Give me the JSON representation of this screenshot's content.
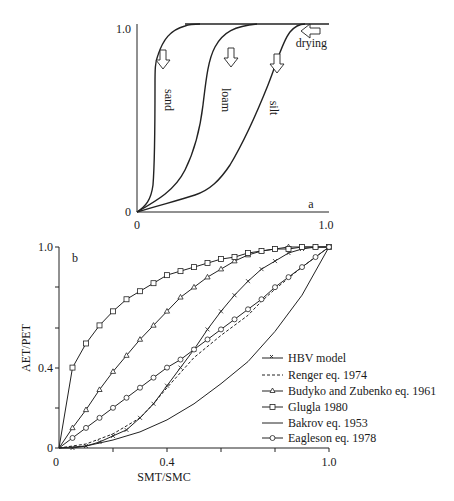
{
  "chart_data": [
    {
      "panel": "a",
      "type": "line",
      "title": "",
      "panel_label": "a",
      "xlabel": "",
      "ylabel": "",
      "xlim": [
        0,
        1.0
      ],
      "ylim": [
        0,
        1.0
      ],
      "x_ticks": [
        "0",
        "1.0"
      ],
      "y_ticks": [
        "0",
        "1.0"
      ],
      "grid": false,
      "annotations": [
        "drying"
      ],
      "series": [
        {
          "name": "sand",
          "x": [
            0,
            0.05,
            0.08,
            0.09,
            0.1,
            0.1,
            0.11,
            0.12,
            0.15,
            0.2,
            0.25,
            0.3,
            1.0
          ],
          "y": [
            0,
            0.05,
            0.15,
            0.4,
            0.6,
            0.8,
            0.9,
            0.93,
            0.97,
            0.99,
            1.0,
            1.0,
            1.0
          ]
        },
        {
          "name": "loam",
          "x": [
            0,
            0.1,
            0.2,
            0.25,
            0.3,
            0.35,
            0.38,
            0.42,
            0.5,
            0.6,
            0.7,
            1.0
          ],
          "y": [
            0,
            0.07,
            0.2,
            0.3,
            0.45,
            0.65,
            0.78,
            0.87,
            0.95,
            0.99,
            1.0,
            1.0
          ]
        },
        {
          "name": "silt",
          "x": [
            0,
            0.15,
            0.3,
            0.4,
            0.5,
            0.6,
            0.7,
            0.8,
            0.85,
            1.0
          ],
          "y": [
            0,
            0.06,
            0.12,
            0.25,
            0.45,
            0.65,
            0.85,
            0.98,
            1.0,
            1.0
          ]
        }
      ]
    },
    {
      "panel": "b",
      "type": "line",
      "title": "",
      "panel_label": "b",
      "xlabel": "SMT/SMC",
      "ylabel": "AET/PET",
      "xlim": [
        0,
        1.0
      ],
      "ylim": [
        0,
        1.0
      ],
      "x_ticks": [
        "0",
        "0.4",
        "1.0"
      ],
      "y_ticks": [
        "0",
        "0.4",
        "1.0"
      ],
      "grid": false,
      "legend_position": "lower right",
      "series": [
        {
          "name": "HBV model",
          "marker": "x",
          "style": "solid",
          "x": [
            0,
            0.05,
            0.1,
            0.15,
            0.2,
            0.25,
            0.3,
            0.35,
            0.4,
            0.45,
            0.5,
            0.55,
            0.6,
            0.65,
            0.7,
            0.75,
            0.8,
            0.85,
            0.9,
            0.95,
            1.0
          ],
          "y": [
            0,
            0.0,
            0.01,
            0.03,
            0.06,
            0.09,
            0.15,
            0.22,
            0.31,
            0.4,
            0.49,
            0.59,
            0.68,
            0.76,
            0.83,
            0.89,
            0.93,
            0.97,
            0.99,
            1.0,
            1.0
          ]
        },
        {
          "name": "Renger eq. 1974",
          "marker": "none",
          "style": "dashed",
          "x": [
            0,
            0.1,
            0.2,
            0.3,
            0.35,
            0.4,
            0.5,
            0.6,
            0.7,
            0.75,
            0.8,
            0.9,
            1.0
          ],
          "y": [
            0,
            0.02,
            0.07,
            0.15,
            0.22,
            0.3,
            0.45,
            0.56,
            0.66,
            0.73,
            0.79,
            0.9,
            1.0
          ]
        },
        {
          "name": "Budyko and Zubenko eq. 1961",
          "marker": "triangle",
          "style": "solid",
          "x": [
            0,
            0.05,
            0.1,
            0.15,
            0.2,
            0.25,
            0.3,
            0.35,
            0.4,
            0.45,
            0.5,
            0.55,
            0.6,
            0.65,
            0.7,
            0.75,
            0.8,
            0.85,
            0.9,
            0.95,
            1.0
          ],
          "y": [
            0,
            0.1,
            0.19,
            0.29,
            0.38,
            0.46,
            0.54,
            0.61,
            0.68,
            0.75,
            0.8,
            0.85,
            0.89,
            0.93,
            0.96,
            0.98,
            0.99,
            1.0,
            1.0,
            1.0,
            1.0
          ]
        },
        {
          "name": "Glugla 1980",
          "marker": "square",
          "style": "solid",
          "x": [
            0,
            0.05,
            0.1,
            0.15,
            0.2,
            0.25,
            0.3,
            0.35,
            0.4,
            0.45,
            0.5,
            0.55,
            0.6,
            0.65,
            0.7,
            0.75,
            0.8,
            0.85,
            0.9,
            0.95,
            1.0
          ],
          "y": [
            0,
            0.4,
            0.52,
            0.61,
            0.68,
            0.74,
            0.78,
            0.82,
            0.86,
            0.88,
            0.9,
            0.92,
            0.94,
            0.95,
            0.97,
            0.98,
            0.99,
            0.99,
            1.0,
            1.0,
            1.0
          ]
        },
        {
          "name": "Bakrov eq. 1953",
          "marker": "none",
          "style": "solid",
          "x": [
            0,
            0.1,
            0.2,
            0.3,
            0.4,
            0.5,
            0.6,
            0.7,
            0.8,
            0.9,
            1.0
          ],
          "y": [
            0,
            0.01,
            0.04,
            0.08,
            0.14,
            0.22,
            0.32,
            0.43,
            0.58,
            0.76,
            1.0
          ]
        },
        {
          "name": "Eagleson eq. 1978",
          "marker": "circle",
          "style": "solid",
          "x": [
            0,
            0.05,
            0.1,
            0.15,
            0.2,
            0.25,
            0.3,
            0.35,
            0.4,
            0.45,
            0.5,
            0.55,
            0.6,
            0.65,
            0.7,
            0.75,
            0.8,
            0.85,
            0.9,
            0.95,
            1.0
          ],
          "y": [
            0,
            0.05,
            0.1,
            0.15,
            0.2,
            0.25,
            0.3,
            0.35,
            0.4,
            0.44,
            0.49,
            0.54,
            0.59,
            0.64,
            0.69,
            0.74,
            0.8,
            0.85,
            0.9,
            0.95,
            1.0
          ]
        }
      ]
    }
  ],
  "panel_a": {
    "label": "a",
    "y_top": "1.0",
    "y_zero": "0",
    "x_zero": "0",
    "x_end": "1.0",
    "annotation": "drying",
    "curve_labels": [
      "sand",
      "loam",
      "silt"
    ]
  },
  "panel_b": {
    "label": "b",
    "xlabel": "SMT/SMC",
    "ylabel": "AET/PET",
    "y_ticks": [
      "1.0",
      "0.4",
      "0"
    ],
    "x_ticks": [
      "0",
      "0.4",
      "1.0"
    ],
    "legend": [
      "HBV model",
      "Renger eq. 1974",
      "Budyko and Zubenko eq. 1961",
      "Glugla 1980",
      "Bakrov eq. 1953",
      "Eagleson eq. 1978"
    ]
  }
}
